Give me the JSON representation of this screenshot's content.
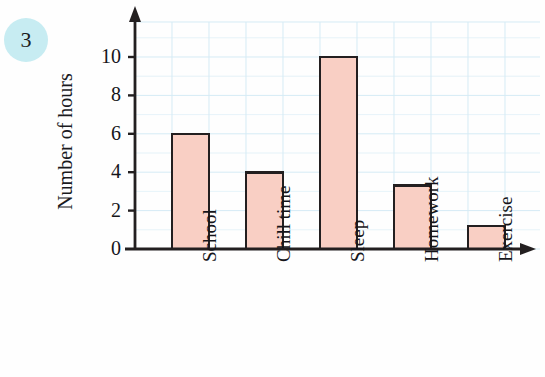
{
  "question": {
    "number": "3"
  },
  "chart_data": {
    "type": "bar",
    "title": "",
    "xlabel": "",
    "ylabel": "Number of hours",
    "categories": [
      "School",
      "Chill time",
      "Sleep",
      "Homework",
      "Exercise"
    ],
    "values": [
      6,
      4,
      10,
      3.3,
      1.2
    ],
    "ylim": [
      0,
      11.5
    ],
    "y_ticks": [
      0,
      2,
      4,
      6,
      8,
      10
    ],
    "y_tick_labels": [
      "0",
      "2",
      "4",
      "6",
      "8",
      "10"
    ],
    "grid": true,
    "legend": null,
    "colors": {
      "bar_fill": "#f9cfc4",
      "bar_edge": "#231f20",
      "grid": "#d5ebf5",
      "axis": "#231f20",
      "badge": "#c7ecf2",
      "text": "#15151a",
      "background": "#fefefe"
    }
  }
}
